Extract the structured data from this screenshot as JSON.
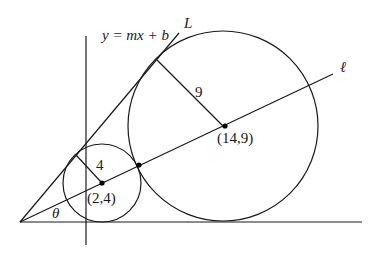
{
  "diagram": {
    "labels": {
      "line_equation": "y = mx + b",
      "line_L": "L",
      "line_ell": "ℓ",
      "angle": "θ",
      "small_radius": "4",
      "large_radius": "9",
      "small_center": "(2,4)",
      "large_center": "(14,9)"
    },
    "small_circle": {
      "center": [
        2,
        4
      ],
      "radius": 4
    },
    "large_circle": {
      "center": [
        14,
        9
      ],
      "radius": 9
    }
  }
}
